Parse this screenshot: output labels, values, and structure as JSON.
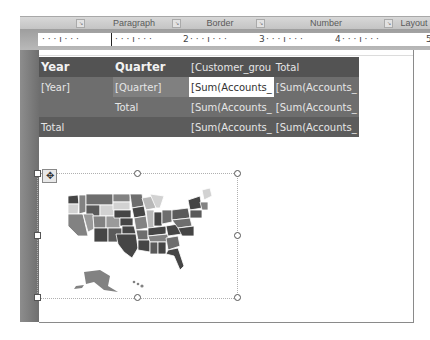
{
  "ribbon": {
    "groups": [
      {
        "label": "Paragraph"
      },
      {
        "label": "Border"
      },
      {
        "label": "Number"
      },
      {
        "label": "Layout"
      }
    ]
  },
  "ruler": {
    "marks": [
      "1",
      "2",
      "3",
      "4",
      "5"
    ]
  },
  "tablix": {
    "header": [
      "Year",
      "Quarter",
      "[Customer_grou",
      "Total"
    ],
    "rows": [
      [
        "[Year]",
        "[Quarter]",
        "[Sum(Accounts_",
        "[Sum(Accounts_"
      ],
      [
        "",
        "Total",
        "[Sum(Accounts_",
        "[Sum(Accounts_"
      ],
      [
        "Total",
        "",
        "[Sum(Accounts_",
        "[Sum(Accounts_"
      ]
    ]
  },
  "map": {
    "name": "US states map",
    "state_colors": [
      "#454545",
      "#5a5a5a",
      "#6e6e6e",
      "#828282",
      "#9a9a9a",
      "#b8b8b8",
      "#d2d2d2"
    ]
  },
  "icons": {
    "move": "✥",
    "launcher": "↘"
  }
}
